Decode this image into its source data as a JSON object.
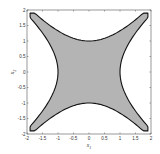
{
  "chart_data": {
    "type": "area",
    "title": "",
    "xlabel": "x1",
    "ylabel": "x2",
    "xlim": [
      -2,
      2
    ],
    "ylim": [
      -2,
      2
    ],
    "xticks": [
      "-2",
      "-1.5",
      "-1",
      "-0.5",
      "0",
      "0.5",
      "1",
      "1.5",
      "2"
    ],
    "yticks": [
      "-2",
      "-1.5",
      "-1",
      "-0.5",
      "0",
      "0.5",
      "1",
      "1.5",
      "2"
    ],
    "grid": false,
    "legend": null,
    "region": {
      "fill": "#b4b4b4",
      "edge": "#111111",
      "key_points": [
        {
          "x": 0,
          "y": 1
        },
        {
          "x": 0,
          "y": -1
        },
        {
          "x": 1,
          "y": 0
        },
        {
          "x": -1,
          "y": 0
        },
        {
          "x": 1.9,
          "y": 1.9
        },
        {
          "x": -1.9,
          "y": 1.9
        },
        {
          "x": 1.9,
          "y": -1.9
        },
        {
          "x": -1.9,
          "y": -1.9
        }
      ]
    }
  }
}
